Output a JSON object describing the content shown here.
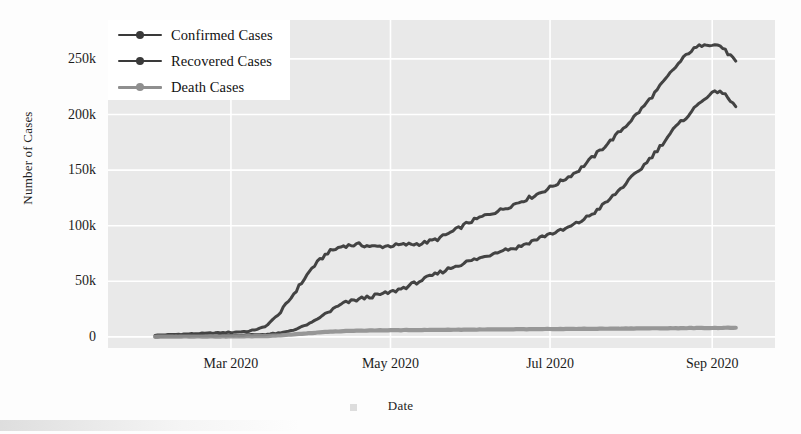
{
  "chart_data": {
    "type": "line",
    "title": "",
    "xlabel": "Date",
    "ylabel": "Number of Cases",
    "grid": true,
    "legend_position": "upper-left",
    "xlim": [
      "2020-02-01",
      "2020-09-10"
    ],
    "ylim": [
      -10000,
      285000
    ],
    "xticks": [
      "Mar 2020",
      "May 2020",
      "Jul 2020",
      "Sep 2020"
    ],
    "xtick_days": [
      29,
      90,
      151,
      213
    ],
    "yticks": [
      0,
      50000,
      100000,
      150000,
      200000,
      250000
    ],
    "ytick_labels": [
      "0",
      "50k",
      "100k",
      "150k",
      "200k",
      "250k"
    ],
    "x_days": [
      0,
      6,
      12,
      18,
      24,
      30,
      36,
      42,
      48,
      54,
      60,
      66,
      72,
      78,
      84,
      90,
      96,
      102,
      108,
      114,
      120,
      126,
      132,
      138,
      144,
      150,
      156,
      162,
      168,
      174,
      180,
      186,
      192,
      198,
      204,
      210,
      216,
      222
    ],
    "series": [
      {
        "name": "Confirmed Cases",
        "color": "#3a3a3a",
        "values": [
          1500,
          2000,
          2600,
          3100,
          3600,
          4200,
          5000,
          9000,
          22000,
          42000,
          62000,
          76000,
          82000,
          83000,
          81000,
          82000,
          83000,
          84000,
          88000,
          95000,
          103000,
          109000,
          114000,
          120000,
          126000,
          133000,
          141000,
          150000,
          163000,
          176000,
          190000,
          205000,
          222000,
          240000,
          256000,
          264000,
          262000,
          248000
        ]
      },
      {
        "name": "Recovered Cases",
        "color": "#3a3a3a",
        "values": [
          300,
          500,
          700,
          900,
          1100,
          1400,
          1700,
          2200,
          3400,
          7000,
          13000,
          22000,
          30000,
          34000,
          37000,
          40000,
          45000,
          51000,
          57000,
          63000,
          68000,
          72000,
          78000,
          80000,
          86000,
          92000,
          96000,
          103000,
          112000,
          124000,
          138000,
          152000,
          168000,
          186000,
          200000,
          215000,
          222000,
          207000
        ]
      },
      {
        "name": "Death Cases",
        "color": "#8f8f8f",
        "values": [
          200,
          250,
          300,
          350,
          400,
          450,
          550,
          800,
          1400,
          2400,
          3500,
          4500,
          5200,
          5600,
          5800,
          6000,
          6100,
          6200,
          6300,
          6400,
          6500,
          6600,
          6700,
          6800,
          6900,
          7000,
          7100,
          7200,
          7300,
          7400,
          7500,
          7600,
          7700,
          7800,
          7900,
          8000,
          8100,
          8200
        ]
      }
    ]
  },
  "legend": {
    "items": [
      {
        "label": "Confirmed Cases",
        "color": "#3a3a3a"
      },
      {
        "label": "Recovered Cases",
        "color": "#3a3a3a"
      },
      {
        "label": "Death Cases",
        "color": "#8f8f8f"
      }
    ]
  },
  "axes": {
    "x_title": "Date",
    "y_title": "Number of Cases"
  }
}
